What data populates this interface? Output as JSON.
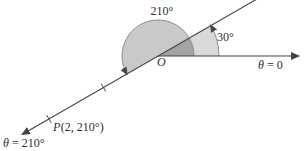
{
  "figure": {
    "labels": {
      "big_angle": "210°",
      "small_angle": "30°",
      "origin": "O",
      "axis": {
        "sym": "θ",
        "rest": "= 0"
      },
      "ray": {
        "sym": "θ",
        "rest": "= 210°"
      },
      "point": {
        "sym": "P",
        "rest": "(2, 210°)"
      }
    },
    "colors": {
      "sector_large": "#c9c9c9",
      "sector_small": "#d9d9d9",
      "sector_overlap": "#a3a3a3",
      "line": "#454545",
      "arc_stroke": "#8f8f8f",
      "text": "#2e2e2e"
    }
  }
}
